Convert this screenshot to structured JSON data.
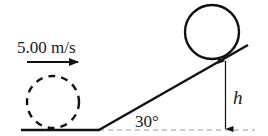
{
  "diagram": {
    "velocity_label": "5.00 m/s",
    "angle_label": "30°",
    "height_label": "h",
    "elements": {
      "initial_ball": "dashed circle on ground (initial position)",
      "final_ball": "solid circle at rest on incline",
      "velocity_arrow": "arrow pointing right",
      "incline": "ramp inclined at 30 degrees",
      "height_marker": "vertical double-ended arrow marking height h"
    },
    "colors": {
      "stroke": "#111111",
      "dashed_reference": "#9a9a9a"
    }
  }
}
